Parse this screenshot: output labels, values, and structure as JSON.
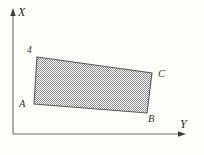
{
  "figure": {
    "background_color": "#fdfdfa",
    "line_color": "#555555",
    "fill_color": "#b3b3b3",
    "axes": {
      "x_axis_label": "X",
      "y_axis_label": "Y",
      "origin": {
        "x": 13,
        "y": 134
      },
      "x_axis_tip": {
        "x": 13,
        "y": 11
      },
      "y_axis_tip": {
        "x": 186,
        "y": 134
      }
    },
    "shape": {
      "type": "parallelogram",
      "vertices": [
        {
          "label": "4",
          "x": 37,
          "y": 57
        },
        {
          "label": "C",
          "x": 152,
          "y": 73
        },
        {
          "label": "B",
          "x": 147,
          "y": 113
        },
        {
          "label": "A",
          "x": 34,
          "y": 104
        }
      ],
      "fill_pattern": "checkerboard-stipple"
    },
    "labels": {
      "axis_x": "X",
      "axis_y": "Y",
      "vertex_top_left": "4",
      "vertex_a": "A",
      "vertex_b": "B",
      "vertex_c": "C"
    }
  }
}
